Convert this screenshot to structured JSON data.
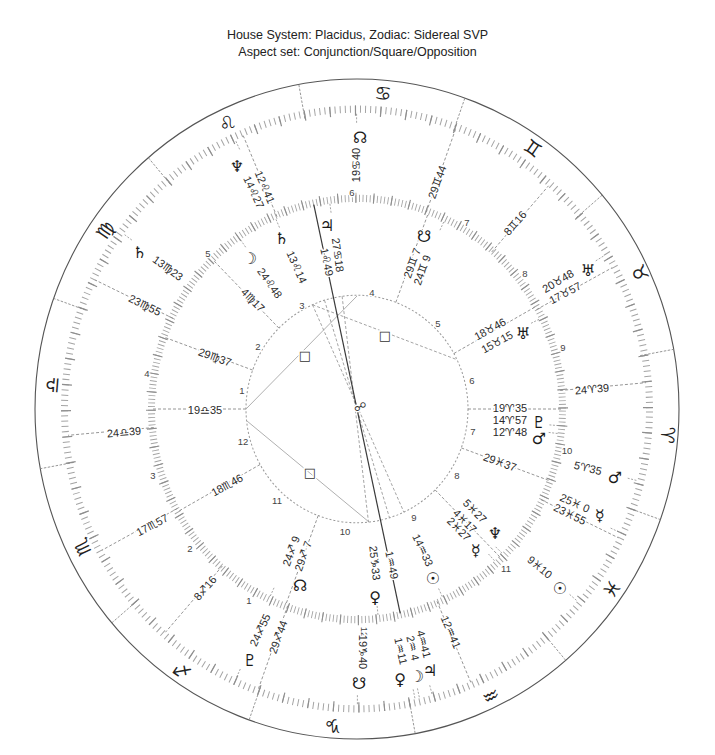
{
  "header": {
    "line1": "House System: Placidus, Zodiac: Sidereal SVP",
    "line2": "Aspect set: Conjunction/Square/Opposition"
  },
  "theme": {
    "ink": "#222222",
    "line": "#8a8a8a",
    "axis": "#3a3a3a",
    "background": "#ffffff"
  },
  "zodiac": {
    "signs": [
      {
        "name": "aries",
        "glyph": "♈"
      },
      {
        "name": "taurus",
        "glyph": "♉"
      },
      {
        "name": "gemini",
        "glyph": "♊"
      },
      {
        "name": "cancer",
        "glyph": "♋"
      },
      {
        "name": "leo",
        "glyph": "♌"
      },
      {
        "name": "virgo",
        "glyph": "♍"
      },
      {
        "name": "libra",
        "glyph": "♎"
      },
      {
        "name": "scorpio",
        "glyph": "♏"
      },
      {
        "name": "sagittarius",
        "glyph": "♐"
      },
      {
        "name": "capricorn",
        "glyph": "♑"
      },
      {
        "name": "aquarius",
        "glyph": "♒"
      },
      {
        "name": "pisces",
        "glyph": "♓"
      }
    ]
  },
  "inner_wheel": {
    "house_numbers": [
      "1",
      "2",
      "3",
      "4",
      "5",
      "6",
      "7",
      "8",
      "9",
      "10",
      "11",
      "12"
    ],
    "cusps": [
      "19♎35",
      "29♍37",
      "4♍17",
      "1♌49",
      "29♊ 7",
      "18♉46",
      "19♈35",
      "29♓37",
      "4♓17",
      "1♒49",
      "29♐ 7",
      "18♏46"
    ],
    "planets": [
      {
        "name": "moon",
        "glyph": "☽",
        "position": "24♌48"
      },
      {
        "name": "saturn",
        "glyph": "♄",
        "position": "13♌14"
      },
      {
        "name": "jupiter",
        "glyph": "♃",
        "position": "27♋18"
      },
      {
        "name": "south-node",
        "glyph": "☋",
        "position": "24♊ 9"
      },
      {
        "name": "uranus",
        "glyph": "♅",
        "position": "15♉15"
      },
      {
        "name": "pluto",
        "glyph": "♇",
        "position": "14♈57"
      },
      {
        "name": "mars",
        "glyph": "♂",
        "position": "12♈48"
      },
      {
        "name": "neptune",
        "glyph": "♆",
        "position": "5♓27"
      },
      {
        "name": "mercury",
        "glyph": "☿",
        "position": "2♓27"
      },
      {
        "name": "sun",
        "glyph": "☉",
        "position": "14♒33"
      },
      {
        "name": "venus",
        "glyph": "♀",
        "position": "25♑33"
      },
      {
        "name": "north-node",
        "glyph": "☊",
        "position": "24♐ 9"
      }
    ]
  },
  "outer_wheel": {
    "house_numbers": [
      "1",
      "2",
      "3",
      "4",
      "5",
      "6",
      "7",
      "8",
      "9",
      "10",
      "11",
      "12"
    ],
    "cusps": [
      "24♎39",
      "23♍55",
      "12♌41",
      "29♊44",
      "8♊16",
      "17♉57",
      "24♈39",
      "23♓55",
      "12♒41",
      "29♐44",
      "8♐16",
      "17♏57"
    ],
    "planets": [
      {
        "name": "neptune",
        "glyph": "♆",
        "position": "14♌27"
      },
      {
        "name": "north-node",
        "glyph": "☊",
        "position": "19♋40"
      },
      {
        "name": "uranus",
        "glyph": "♅",
        "position": "20♉48"
      },
      {
        "name": "mars",
        "glyph": "♂",
        "position": "5♈35"
      },
      {
        "name": "mercury",
        "glyph": "☿",
        "position": "25♓ 0"
      },
      {
        "name": "sun",
        "glyph": "☉",
        "position": "9♓10"
      },
      {
        "name": "jupiter",
        "glyph": "♃",
        "position": "4♒41"
      },
      {
        "name": "moon",
        "glyph": "☽",
        "position": "2♒ 4"
      },
      {
        "name": "venus",
        "glyph": "♀",
        "position": "1♒11"
      },
      {
        "name": "south-node",
        "glyph": "☋",
        "position": "19♑40"
      },
      {
        "name": "pluto",
        "glyph": "♇",
        "position": "24♐55"
      },
      {
        "name": "saturn",
        "glyph": "♄",
        "position": "13♍23"
      }
    ]
  },
  "aspects": {
    "square_symbol": "□",
    "opposition_symbol": "☍",
    "squares_shown": 3
  }
}
